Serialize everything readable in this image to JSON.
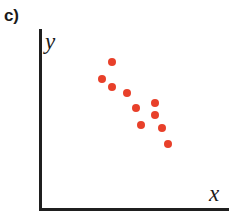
{
  "figure": {
    "panel_label": "c)",
    "width": 231,
    "height": 224,
    "background_color": "#ffffff"
  },
  "axes": {
    "x_label": "x",
    "y_label": "y",
    "axis_color": "#1f1f1f",
    "x_axis_pixel_y": 209,
    "y_axis_pixel_x": 40,
    "origin_pixel": [
      40,
      209
    ],
    "x_axis_end_pixel": [
      228,
      209
    ],
    "y_axis_top_pixel": [
      40,
      29
    ]
  },
  "chart_data": {
    "type": "scatter",
    "title": "c)",
    "xlabel": "x",
    "ylabel": "y",
    "grid": false,
    "legend": null,
    "axis_ticks": false,
    "point_color": "#e8402a",
    "point_diameter_px": 8,
    "n_points": 10,
    "xlim": [
      0,
      100
    ],
    "ylim": [
      0,
      100
    ],
    "pixel_points": [
      [
        112,
        62
      ],
      [
        102,
        79
      ],
      [
        112,
        87
      ],
      [
        127,
        93
      ],
      [
        155,
        103
      ],
      [
        136,
        108
      ],
      [
        155,
        115
      ],
      [
        141,
        125
      ],
      [
        162,
        128
      ],
      [
        168,
        144
      ]
    ],
    "x": [
      38,
      33,
      38,
      46,
      61,
      51,
      61,
      54,
      65,
      68
    ],
    "y": [
      82,
      72,
      68,
      64,
      59,
      56,
      52,
      47,
      45,
      36
    ],
    "points": [
      {
        "x": 38,
        "y": 82
      },
      {
        "x": 33,
        "y": 72
      },
      {
        "x": 38,
        "y": 68
      },
      {
        "x": 46,
        "y": 64
      },
      {
        "x": 61,
        "y": 59
      },
      {
        "x": 51,
        "y": 56
      },
      {
        "x": 61,
        "y": 52
      },
      {
        "x": 54,
        "y": 47
      },
      {
        "x": 65,
        "y": 45
      },
      {
        "x": 68,
        "y": 36
      }
    ]
  }
}
